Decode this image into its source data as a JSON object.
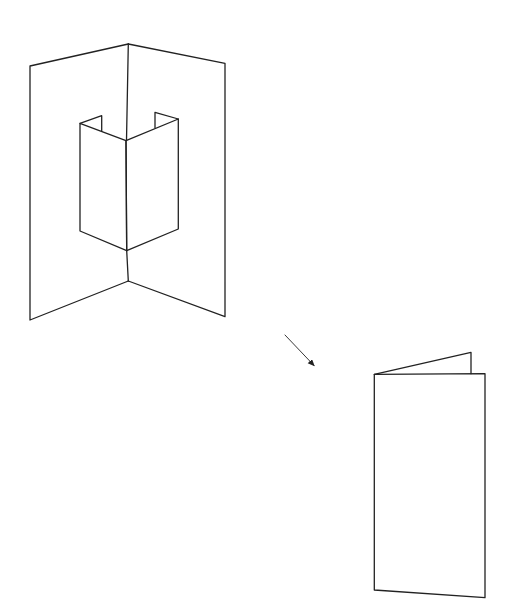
{
  "diagram": {
    "stroke_color": "#222222",
    "background_color": "#ffffff",
    "parts": [
      {
        "name": "open-card-with-popup",
        "state": "open"
      },
      {
        "name": "arrow",
        "direction": "down-right"
      },
      {
        "name": "closed-card",
        "state": "folded"
      }
    ]
  }
}
